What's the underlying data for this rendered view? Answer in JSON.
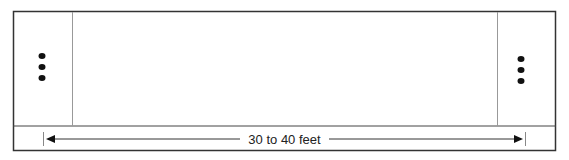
{
  "diagram": {
    "measurement_label": "30 to 40 feet",
    "left_zone_markers": 3,
    "right_zone_markers": 3,
    "colors": {
      "stroke": "#333333",
      "thin": "#888888",
      "fill": "#111111"
    }
  }
}
